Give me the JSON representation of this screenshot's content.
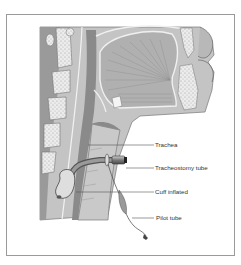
{
  "figure": {
    "labels": [
      {
        "id": "trachea",
        "text": "Trachea"
      },
      {
        "id": "tracheostomy_tube",
        "text": "Tracheostomy tube"
      },
      {
        "id": "cuff",
        "text": "Cuff inflated"
      },
      {
        "id": "pilot_tube",
        "text": "Pilot tube"
      }
    ]
  },
  "colors": {
    "frame": "#9a9a9a",
    "tissue": "#bdbdbd",
    "tissue_dark": "#8c8c8c",
    "bone": "#e6e6e6",
    "line": "#333333"
  }
}
